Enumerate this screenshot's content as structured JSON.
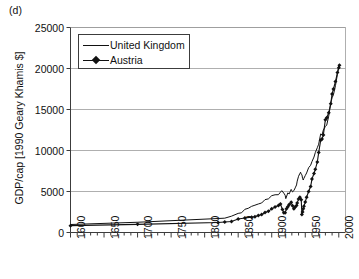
{
  "figure": {
    "panel_label": "(d)",
    "background_color": "#ffffff",
    "axis_color": "#3c3c3c",
    "grid_color": "#9a9a9a",
    "series_color": "#111111"
  },
  "legend": {
    "position": "top-left-inside",
    "entries": [
      {
        "label": "United Kingdom",
        "key": "line"
      },
      {
        "label": "Austria",
        "key": "line-with-diamond-marker"
      }
    ]
  },
  "chart_data": {
    "type": "line",
    "title": "",
    "subtitle": "",
    "panel": "(d)",
    "xlabel": "",
    "ylabel": "GDP/cap [1990 Geary Khamis $]",
    "xlim": [
      1600,
      2010
    ],
    "ylim": [
      0,
      25000
    ],
    "xticks": [
      1600,
      1650,
      1700,
      1750,
      1800,
      1850,
      1900,
      1950,
      2000
    ],
    "xtick_labels": [
      "1600",
      "1650",
      "1700",
      "1750",
      "1800",
      "1850",
      "1900",
      "1950",
      "2000"
    ],
    "xminor_tick_interval": 10,
    "yticks": [
      0,
      5000,
      10000,
      15000,
      20000,
      25000
    ],
    "ytick_labels": [
      "0",
      "5000",
      "10000",
      "15000",
      "20000",
      "25000"
    ],
    "grid": "horizontal-only",
    "legend_position": "upper-left",
    "series": [
      {
        "name": "United Kingdom",
        "style": "solid-line",
        "marker": "none",
        "x": [
          1600,
          1700,
          1820,
          1830,
          1840,
          1850,
          1855,
          1860,
          1865,
          1870,
          1875,
          1880,
          1885,
          1890,
          1895,
          1900,
          1905,
          1910,
          1913,
          1915,
          1918,
          1920,
          1921,
          1924,
          1926,
          1929,
          1931,
          1933,
          1935,
          1937,
          1938,
          1940,
          1942,
          1943,
          1944,
          1945,
          1946,
          1947,
          1948,
          1950,
          1952,
          1955,
          1958,
          1960,
          1963,
          1965,
          1968,
          1970,
          1973,
          1975,
          1977,
          1980,
          1982,
          1985,
          1988,
          1990,
          1992,
          1995,
          1998,
          2000,
          2001
        ],
        "y": [
          974,
          1250,
          1706,
          1749,
          1990,
          2330,
          2404,
          2830,
          2950,
          3190,
          3330,
          3477,
          3600,
          4009,
          4100,
          4492,
          4600,
          4611,
          4921,
          5100,
          4800,
          4548,
          4130,
          4830,
          4700,
          5255,
          4950,
          5100,
          5441,
          5800,
          6266,
          6856,
          7200,
          7350,
          7100,
          7056,
          6600,
          6400,
          6620,
          6939,
          7260,
          7900,
          8200,
          8645,
          9200,
          9752,
          10350,
          10767,
          12022,
          11900,
          12500,
          12931,
          13100,
          14200,
          15800,
          16430,
          16800,
          17900,
          19300,
          20353,
          20500
        ]
      },
      {
        "name": "Austria",
        "style": "line-with-markers",
        "marker": "diamond",
        "x": [
          1600,
          1700,
          1820,
          1830,
          1840,
          1850,
          1860,
          1870,
          1875,
          1880,
          1885,
          1890,
          1895,
          1900,
          1905,
          1910,
          1913,
          1916,
          1918,
          1920,
          1922,
          1924,
          1926,
          1929,
          1931,
          1933,
          1935,
          1937,
          1938,
          1940,
          1942,
          1944,
          1945,
          1946,
          1947,
          1948,
          1950,
          1952,
          1955,
          1958,
          1960,
          1963,
          1965,
          1968,
          1970,
          1973,
          1975,
          1977,
          1980,
          1982,
          1985,
          1988,
          1990,
          1992,
          1995,
          1998,
          2000,
          2001
        ],
        "y": [
          837,
          993,
          1218,
          1280,
          1350,
          1650,
          1778,
          1863,
          1930,
          2079,
          2180,
          2443,
          2600,
          2882,
          3100,
          3290,
          3465,
          2800,
          2400,
          2412,
          2900,
          3150,
          3400,
          3699,
          3250,
          2900,
          3100,
          3300,
          3583,
          4100,
          4300,
          4000,
          2200,
          2500,
          2900,
          3200,
          3706,
          4300,
          5000,
          5600,
          6519,
          7200,
          7700,
          8600,
          9747,
          11235,
          11400,
          11900,
          13759,
          14000,
          14600,
          15700,
          16905,
          17500,
          18400,
          19500,
          20097,
          20400
        ]
      }
    ],
    "annotations": [
      {
        "text": "WWII trough for Austria near 1945",
        "x": 1945,
        "y": 2200
      },
      {
        "text": "UK wartime peak near 1943",
        "x": 1943,
        "y": 7350
      }
    ]
  }
}
